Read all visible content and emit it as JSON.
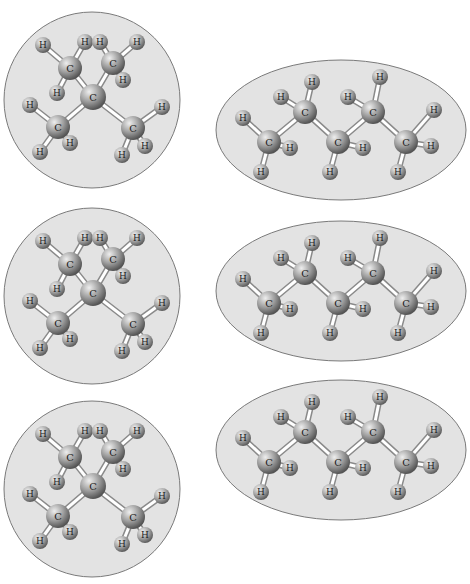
{
  "colors": {
    "background": "#ffffff",
    "panel_fill": "#e3e3e3",
    "panel_stroke": "#7a7a7a",
    "atom_light": "#e8e8e8",
    "atom_dark": "#6e6e6e",
    "bond": "#ffffff",
    "bond_edge": "#8a8a8a"
  },
  "labels": {
    "carbon": "C",
    "hydrogen": "H"
  },
  "panels": [
    {
      "id": "branched-1",
      "shape": "circle",
      "x": 5,
      "y": 10,
      "w": 180,
      "h": 180,
      "molecule": "2,2-dimethylbutane-like branched C5H12 (neopentane-type center)"
    },
    {
      "id": "linear-1",
      "shape": "ellipse",
      "x": 215,
      "y": 60,
      "w": 250,
      "h": 140,
      "molecule": "n-pentane C5H12"
    },
    {
      "id": "branched-2",
      "shape": "circle",
      "x": 5,
      "y": 205,
      "w": 180,
      "h": 180,
      "molecule": "branched C5H12"
    },
    {
      "id": "linear-2",
      "shape": "ellipse",
      "x": 215,
      "y": 220,
      "w": 250,
      "h": 140,
      "molecule": "n-pentane C5H12"
    },
    {
      "id": "branched-3",
      "shape": "circle",
      "x": 5,
      "y": 398,
      "w": 180,
      "h": 180,
      "molecule": "branched C5H12"
    },
    {
      "id": "linear-3",
      "shape": "ellipse",
      "x": 215,
      "y": 378,
      "w": 250,
      "h": 140,
      "molecule": "n-pentane C5H12"
    }
  ]
}
